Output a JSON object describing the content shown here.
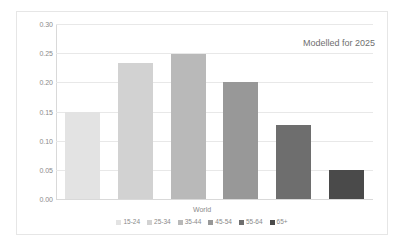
{
  "chart_data": {
    "type": "bar",
    "title": "",
    "subtitle": "",
    "annotation": "Modelled for 2025",
    "xlabel": "World",
    "ylabel": "",
    "categories": [
      "15-24",
      "25-34",
      "35-44",
      "45-54",
      "55-64",
      "65+"
    ],
    "values": [
      0.149,
      0.233,
      0.248,
      0.201,
      0.127,
      0.05
    ],
    "series": [
      {
        "name": "World",
        "values": [
          0.149,
          0.233,
          0.248,
          0.201,
          0.127,
          0.05
        ]
      }
    ],
    "colors": [
      "#e3e3e3",
      "#d2d2d2",
      "#b9b9b9",
      "#989898",
      "#6e6e6e",
      "#4a4a4a"
    ],
    "ylim": [
      0.0,
      0.3
    ],
    "ytick_labels": [
      "0.00",
      "0.05",
      "0.10",
      "0.15",
      "0.20",
      "0.25",
      "0.30"
    ],
    "ytick_values": [
      0.0,
      0.05,
      0.1,
      0.15,
      0.2,
      0.25,
      0.3
    ],
    "grid": true,
    "legend_position": "bottom"
  },
  "legend": {
    "items": [
      {
        "label": "15-24",
        "color": "#e3e3e3"
      },
      {
        "label": "25-34",
        "color": "#d2d2d2"
      },
      {
        "label": "35-44",
        "color": "#b9b9b9"
      },
      {
        "label": "45-54",
        "color": "#989898"
      },
      {
        "label": "55-64",
        "color": "#6e6e6e"
      },
      {
        "label": "65+",
        "color": "#4a4a4a"
      }
    ]
  }
}
